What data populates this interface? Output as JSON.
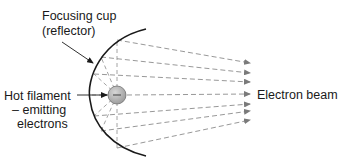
{
  "diagram": {
    "labels": {
      "focusing_cup_line1": "Focusing cup",
      "focusing_cup_line2": "(reflector)",
      "filament_line1": "Hot filament",
      "filament_line2": "– emitting",
      "filament_line3": "electrons",
      "beam": "Electron beam",
      "filament_symbol": "–"
    },
    "colors": {
      "reflector": "#1a1a1a",
      "rays": "#8c8c8c",
      "filament_fill": "#b5b5b5",
      "filament_stroke": "#6e6e6e",
      "text": "#1a1a1a"
    },
    "rays": [
      {
        "from": [
          146,
          31
        ],
        "to": [
          250,
          63
        ]
      },
      {
        "from": [
          101,
          57
        ],
        "to": [
          250,
          73
        ]
      },
      {
        "from": [
          94,
          74
        ],
        "to": [
          250,
          82
        ]
      },
      {
        "from": [
          108,
          95
        ],
        "to": [
          250,
          94
        ]
      },
      {
        "from": [
          94,
          116
        ],
        "to": [
          250,
          104
        ]
      },
      {
        "from": [
          101,
          131
        ],
        "to": [
          250,
          111
        ]
      },
      {
        "from": [
          146,
          150
        ],
        "to": [
          250,
          120
        ]
      }
    ]
  }
}
